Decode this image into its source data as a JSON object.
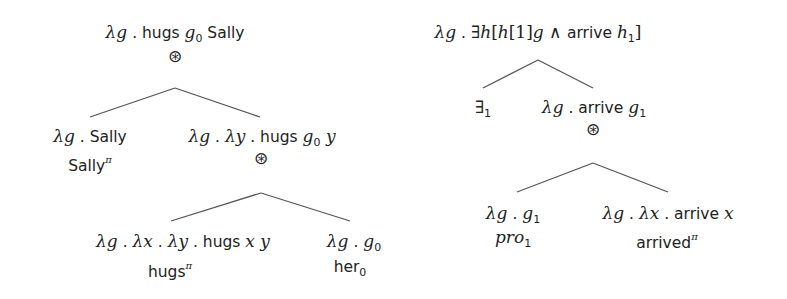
{
  "diagram": {
    "type": "semantic-derivation-trees",
    "composition_operator": "⊛",
    "trees": [
      {
        "id": "tree-hugs",
        "root": {
          "x": 175,
          "y": 22,
          "label": "λg . hugs g0 Sally",
          "segments": [
            {
              "t": "λg",
              "s": "math"
            },
            {
              "t": " . ",
              "s": "sans"
            },
            {
              "t": "hugs ",
              "s": "sans"
            },
            {
              "t": "g",
              "s": "math"
            },
            {
              "t": "0",
              "s": "sub"
            },
            {
              "t": " Sally",
              "s": "sans"
            }
          ],
          "operator": {
            "x": 175,
            "y": 56,
            "symbol": "⊛"
          }
        },
        "edges_top": {
          "apex": [
            175,
            88
          ],
          "left": [
            90,
            117
          ],
          "right": [
            260,
            117
          ]
        },
        "children": [
          {
            "id": "node-sally",
            "x": 90,
            "y": 126,
            "label": "λg . Sally",
            "segments": [
              {
                "t": "λg",
                "s": "math"
              },
              {
                "t": " . Sally",
                "s": "sans"
              }
            ],
            "sublabel": {
              "x": 90,
              "y": 150,
              "label": "Sallyπ",
              "segments": [
                {
                  "t": "Sally",
                  "s": "sans"
                },
                {
                  "t": "π",
                  "s": "sup"
                }
              ]
            }
          },
          {
            "id": "node-hugs-g0-y",
            "x": 262,
            "y": 126,
            "label": "λg . λy . hugs g0 y",
            "segments": [
              {
                "t": "λg",
                "s": "math"
              },
              {
                "t": " . ",
                "s": "sans"
              },
              {
                "t": "λy",
                "s": "math"
              },
              {
                "t": " . hugs ",
                "s": "sans"
              },
              {
                "t": "g",
                "s": "math"
              },
              {
                "t": "0",
                "s": "sub"
              },
              {
                "t": " y",
                "s": "math"
              }
            ],
            "operator": {
              "x": 261,
              "y": 158,
              "symbol": "⊛"
            }
          }
        ],
        "edges_sub": {
          "apex": [
            261,
            193
          ],
          "left": [
            171,
            221
          ],
          "right": [
            350,
            221
          ]
        },
        "grandchildren": [
          {
            "id": "node-hugs-verb",
            "x": 183,
            "y": 231,
            "label": "λg . λx . λy . hugs x y",
            "segments": [
              {
                "t": "λg",
                "s": "math"
              },
              {
                "t": " . ",
                "s": "sans"
              },
              {
                "t": "λx",
                "s": "math"
              },
              {
                "t": " . ",
                "s": "sans"
              },
              {
                "t": "λy",
                "s": "math"
              },
              {
                "t": " . hugs ",
                "s": "sans"
              },
              {
                "t": "x y",
                "s": "math"
              }
            ],
            "sublabel": {
              "x": 170,
              "y": 256,
              "label": "hugsπ",
              "segments": [
                {
                  "t": "hugs",
                  "s": "sans"
                },
                {
                  "t": "π",
                  "s": "sup"
                }
              ]
            }
          },
          {
            "id": "node-her0",
            "x": 354,
            "y": 231,
            "label": "λg . g0",
            "segments": [
              {
                "t": "λg",
                "s": "math"
              },
              {
                "t": " . ",
                "s": "sans"
              },
              {
                "t": "g",
                "s": "math"
              },
              {
                "t": "0",
                "s": "sub"
              }
            ],
            "sublabel": {
              "x": 350,
              "y": 256,
              "label": "her0",
              "segments": [
                {
                  "t": "her",
                  "s": "sans"
                },
                {
                  "t": "0",
                  "s": "sub"
                }
              ]
            }
          }
        ]
      },
      {
        "id": "tree-arrive",
        "root": {
          "x": 538,
          "y": 22,
          "label": "λg . ∃h[h[1]g ∧ arrive h1]",
          "segments": [
            {
              "t": "λg",
              "s": "math"
            },
            {
              "t": " . ",
              "s": "sans"
            },
            {
              "t": "∃",
              "s": "rm"
            },
            {
              "t": "h",
              "s": "math"
            },
            {
              "t": "[",
              "s": "rm"
            },
            {
              "t": "h",
              "s": "math"
            },
            {
              "t": "[1]",
              "s": "rm"
            },
            {
              "t": "g",
              "s": "math"
            },
            {
              "t": " ∧ ",
              "s": "rm"
            },
            {
              "t": "arrive ",
              "s": "sans"
            },
            {
              "t": "h",
              "s": "math"
            },
            {
              "t": "1",
              "s": "sub"
            },
            {
              "t": "]",
              "s": "rm"
            }
          ]
        },
        "edges_top": {
          "apex": [
            538,
            60
          ],
          "left": [
            483,
            88
          ],
          "right": [
            593,
            88
          ]
        },
        "children": [
          {
            "id": "node-exists1",
            "x": 483,
            "y": 97,
            "label": "∃1",
            "segments": [
              {
                "t": "∃",
                "s": "rm"
              },
              {
                "t": "1",
                "s": "sub"
              }
            ]
          },
          {
            "id": "node-arrive-g1",
            "x": 594,
            "y": 97,
            "label": "λg . arrive g1",
            "segments": [
              {
                "t": "λg",
                "s": "math"
              },
              {
                "t": " . arrive ",
                "s": "sans"
              },
              {
                "t": "g",
                "s": "math"
              },
              {
                "t": "1",
                "s": "sub"
              }
            ],
            "operator": {
              "x": 593,
              "y": 129,
              "symbol": "⊛"
            }
          }
        ],
        "edges_sub": {
          "apex": [
            593,
            163
          ],
          "left": [
            517,
            192
          ],
          "right": [
            668,
            192
          ]
        },
        "grandchildren": [
          {
            "id": "node-pro1",
            "x": 513,
            "y": 203,
            "label": "λg . g1",
            "segments": [
              {
                "t": "λg",
                "s": "math"
              },
              {
                "t": " . ",
                "s": "sans"
              },
              {
                "t": "g",
                "s": "math"
              },
              {
                "t": "1",
                "s": "sub"
              }
            ],
            "sublabel": {
              "x": 513,
              "y": 227,
              "label": "pro1",
              "segments": [
                {
                  "t": "pro",
                  "s": "math"
                },
                {
                  "t": "1",
                  "s": "sub"
                }
              ]
            }
          },
          {
            "id": "node-arrived-verb",
            "x": 668,
            "y": 203,
            "label": "λg . λx . arrive x",
            "segments": [
              {
                "t": "λg",
                "s": "math"
              },
              {
                "t": " . ",
                "s": "sans"
              },
              {
                "t": "λx",
                "s": "math"
              },
              {
                "t": " . arrive ",
                "s": "sans"
              },
              {
                "t": "x",
                "s": "math"
              }
            ],
            "sublabel": {
              "x": 667,
              "y": 227,
              "label": "arrivedπ",
              "segments": [
                {
                  "t": "arrived",
                  "s": "sans"
                },
                {
                  "t": "π",
                  "s": "sup"
                }
              ]
            }
          }
        ]
      }
    ]
  }
}
